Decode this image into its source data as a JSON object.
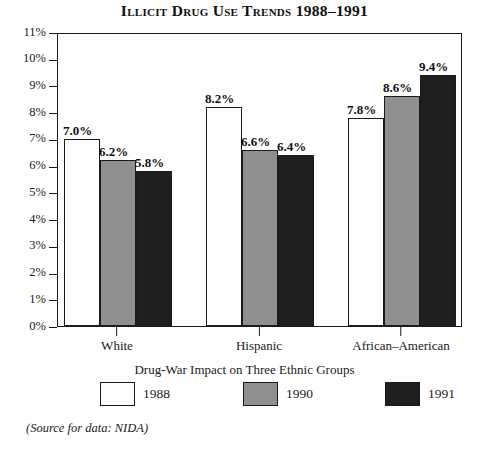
{
  "chart_data": {
    "type": "bar",
    "title": "Illicit Drug Use Trends 1988–1991",
    "subtitle": "Drug-War Impact on Three Ethnic Groups",
    "categories": [
      "White",
      "Hispanic",
      "African–American"
    ],
    "series": [
      {
        "name": "1988",
        "values": [
          7.0,
          8.2,
          7.8
        ],
        "labels": [
          "7.0%",
          "8.2%",
          "7.8%"
        ],
        "color": "#ffffff"
      },
      {
        "name": "1990",
        "values": [
          6.2,
          6.6,
          8.6
        ],
        "labels": [
          "6.2%",
          "6.6%",
          "8.6%"
        ],
        "color": "#8f8f8f"
      },
      {
        "name": "1991",
        "values": [
          5.8,
          6.4,
          9.4
        ],
        "labels": [
          "5.8%",
          "6.4%",
          "9.4%"
        ],
        "color": "#1f1f1f"
      }
    ],
    "xlabel": "",
    "ylabel": "",
    "ylim": [
      0,
      11
    ],
    "ytick_labels": [
      "11%",
      "10%",
      "9%",
      "8%",
      "7%",
      "6%",
      "5%",
      "4%",
      "3%",
      "2%",
      "1%",
      "0%"
    ],
    "ytick_values": [
      11,
      10,
      9,
      8,
      7,
      6,
      5,
      4,
      3,
      2,
      1,
      0
    ],
    "grid": false,
    "legend_position": "bottom",
    "legend_entries": [
      "1988",
      "1990",
      "1991"
    ],
    "source_note": "(Source for data: NIDA)"
  },
  "colors": {
    "axis": "#1a1a1a",
    "text": "#1a1a1a",
    "background": "#ffffff",
    "bar_1988": "#ffffff",
    "bar_1990": "#8f8f8f",
    "bar_1991": "#1f1f1f"
  }
}
